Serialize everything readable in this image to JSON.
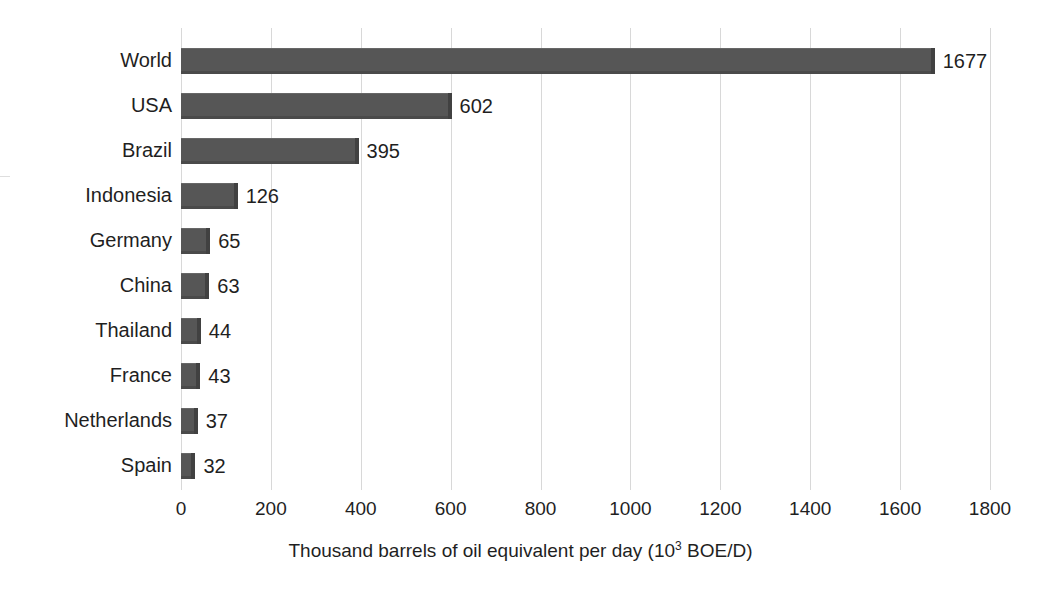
{
  "chart_data": {
    "type": "bar",
    "orientation": "horizontal",
    "title": "",
    "xlabel": "Thousand barrels of oil equivalent per day (10³ BOE/D)",
    "xlabel_parts": {
      "before": "Thousand barrels of oil equivalent per day (10",
      "superscript": "3",
      "after": " BOE/D)"
    },
    "ylabel": "",
    "categories": [
      "World",
      "USA",
      "Brazil",
      "Indonesia",
      "Germany",
      "China",
      "Thailand",
      "France",
      "Netherlands",
      "Spain"
    ],
    "values": [
      1677,
      602,
      395,
      126,
      65,
      63,
      44,
      43,
      37,
      32
    ],
    "value_labels": [
      "1677",
      "602",
      "395",
      "126",
      "65",
      "63",
      "44",
      "43",
      "37",
      "32"
    ],
    "xlim": [
      0,
      1800
    ],
    "xticks": [
      0,
      200,
      400,
      600,
      800,
      1000,
      1200,
      1400,
      1600,
      1800
    ],
    "xtick_labels": [
      "0",
      "200",
      "400",
      "600",
      "800",
      "1000",
      "1200",
      "1400",
      "1600",
      "1800"
    ],
    "grid": "vertical",
    "legend": null,
    "colors": {
      "bar": "#565656",
      "bar_shade": "#414141",
      "gridline": "#d8d8d8",
      "text": "#1f1f1f",
      "background": "#ffffff"
    }
  }
}
